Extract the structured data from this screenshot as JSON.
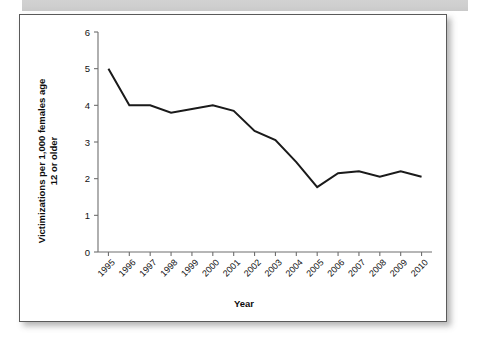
{
  "figure": {
    "frame_border_color": "#5a5a5a",
    "background_color": "#ffffff",
    "top_band_color": "#d2d2d2"
  },
  "chart_data": {
    "type": "line",
    "title": "",
    "xlabel": "Year",
    "ylabel_line1": "Victimizations per 1,000 females age",
    "ylabel_line2": "12 or older",
    "categories": [
      "1995",
      "1996",
      "1997",
      "1998",
      "1999",
      "2000",
      "2001",
      "2002",
      "2003",
      "2004",
      "2005",
      "2006",
      "2007",
      "2008",
      "2009",
      "2010"
    ],
    "values": [
      5.0,
      4.0,
      4.0,
      3.8,
      3.9,
      4.0,
      3.85,
      3.3,
      3.05,
      2.45,
      1.77,
      2.15,
      2.2,
      2.05,
      2.2,
      2.05
    ],
    "series": [
      {
        "name": "Victimizations per 1,000 females age 12 or older",
        "values": [
          5.0,
          4.0,
          4.0,
          3.8,
          3.9,
          4.0,
          3.85,
          3.3,
          3.05,
          2.45,
          1.77,
          2.15,
          2.2,
          2.05,
          2.2,
          2.05
        ],
        "color": "#1a1a1a"
      }
    ],
    "ylim": [
      0,
      6
    ],
    "yticks": [
      0,
      1,
      2,
      3,
      4,
      5,
      6
    ],
    "ytick_labels": [
      "0",
      "1",
      "2",
      "3",
      "4",
      "5",
      "6"
    ],
    "xtick_label_rotation": -45,
    "grid": false,
    "legend": false,
    "legend_position": "none",
    "line_color": "#1a1a1a",
    "axis_color": "#6e6e6e"
  }
}
